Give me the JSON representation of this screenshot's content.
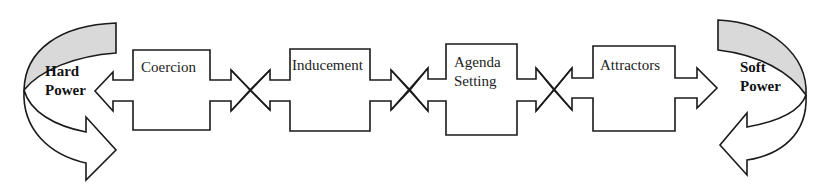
{
  "diagram": {
    "title": "",
    "left_pole": {
      "line1": "Hard",
      "line2": "Power"
    },
    "right_pole": {
      "line1": "Soft",
      "line2": "Power"
    },
    "stages": [
      {
        "line1": "Coercion",
        "line2": ""
      },
      {
        "line1": "Inducement",
        "line2": ""
      },
      {
        "line1": "Agenda",
        "line2": "Setting"
      },
      {
        "line1": "Attractors",
        "line2": ""
      }
    ],
    "colors": {
      "stroke": "#1a1a1a",
      "pole_fill": "#d9d9d9",
      "background": "#ffffff"
    }
  }
}
